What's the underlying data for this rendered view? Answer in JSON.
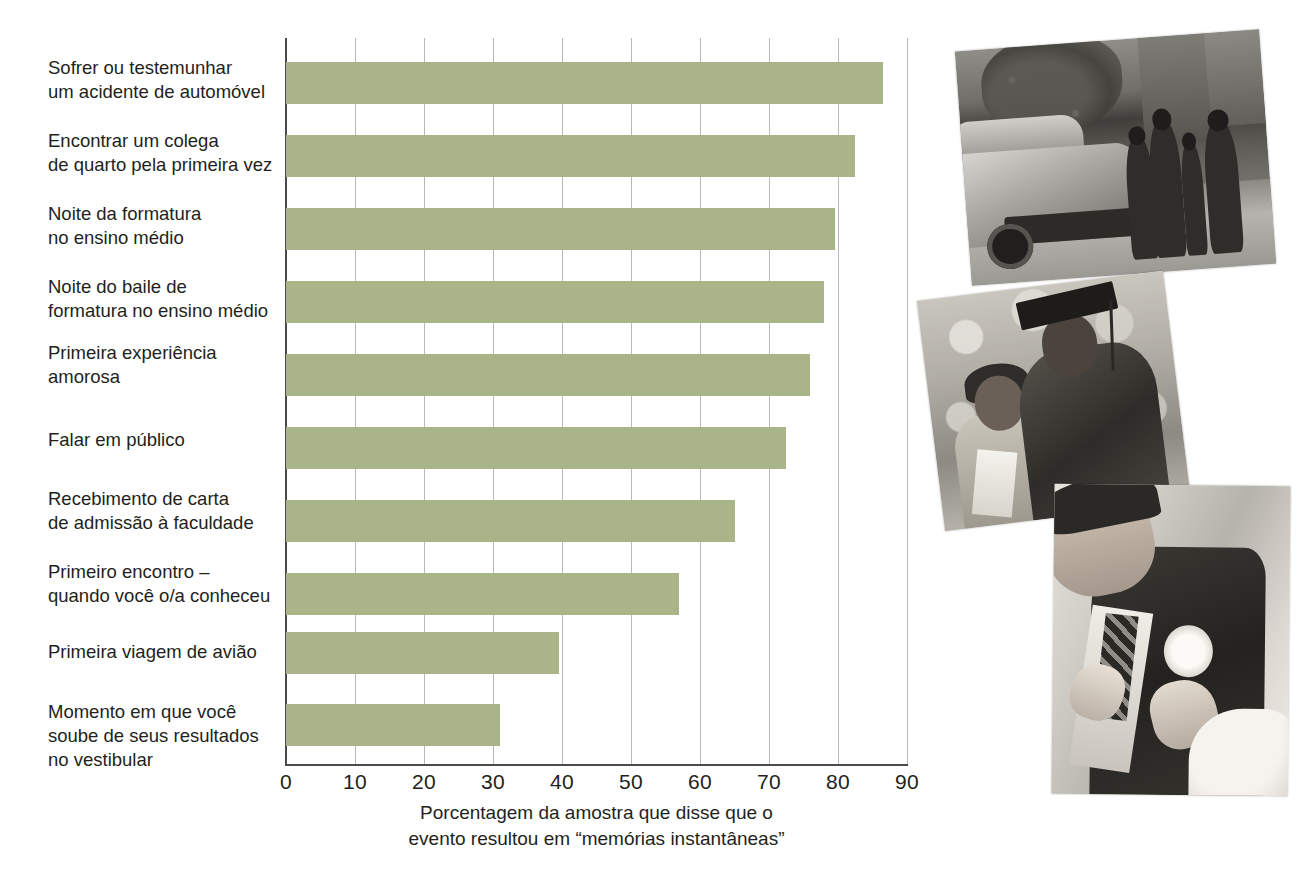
{
  "chart_data": {
    "type": "bar",
    "orientation": "horizontal",
    "title": "",
    "xlabel": "Porcentagem da amostra que disse que o\nevento resultou em “memórias instantâneas”",
    "ylabel": "",
    "xlim": [
      0,
      90
    ],
    "xticks": [
      0,
      10,
      20,
      30,
      40,
      50,
      60,
      70,
      80,
      90
    ],
    "grid": "vertical",
    "legend": "none",
    "bar_color": "#a9b489",
    "categories": [
      "Sofrer ou testemunhar\num acidente de automóvel",
      "Encontrar um colega\nde quarto pela primeira vez",
      "Noite da formatura\nno ensino médio",
      "Noite do baile de\nformatura no ensino médio",
      "Primeira experiência\namorosa",
      "Falar em público",
      "Recebimento de carta\nde admissão à faculdade",
      "Primeiro encontro –\nquando você o/a conheceu",
      "Primeira viagem de avião",
      "Momento em que você\nsoube de seus resultados\nno vestibular"
    ],
    "values": [
      86.5,
      82.5,
      79.5,
      78,
      76,
      72.5,
      65,
      57,
      39.5,
      31
    ]
  },
  "axis": {
    "tick_labels": [
      "0",
      "10",
      "20",
      "30",
      "40",
      "50",
      "60",
      "70",
      "80",
      "90"
    ],
    "title_line1": "Porcentagem da amostra que disse que o",
    "title_line2": "evento resultou em “memórias instantâneas”"
  },
  "photos": [
    {
      "name": "car-accident-photo",
      "alt": "Cena de acidente de automóvel com pessoas ao lado do carro"
    },
    {
      "name": "graduation-photo",
      "alt": "Formando de beca e capelo ao lado da mãe"
    },
    {
      "name": "prom-photo",
      "alt": "Rapaz de terno recebendo flor na lapela"
    }
  ],
  "caption": {
    "cut_off_text": ""
  }
}
